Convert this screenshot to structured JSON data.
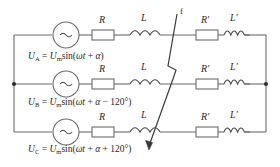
{
  "diagram": {
    "fault_marker_label": "f",
    "phases": [
      {
        "name": "A",
        "source_symbol": "~",
        "equation_html": "<i>U</i><sub>A</sub> = <i>U</i><sub>m</sub>sin(<i>&#969;t</i> + <i>&#945;</i>)",
        "components": [
          {
            "id": "R",
            "label": "R",
            "type": "resistor"
          },
          {
            "id": "L",
            "label": "L",
            "type": "inductor"
          },
          {
            "id": "Rp",
            "label": "R′",
            "type": "resistor"
          },
          {
            "id": "Lp",
            "label": "L′",
            "type": "inductor"
          }
        ]
      },
      {
        "name": "B",
        "source_symbol": "~",
        "equation_html": "<i>U</i><sub>B</sub> = <i>U</i><sub>m</sub>sin(<i>&#969;t</i> + <i>&#945;</i> &#8722; 120&#176;)",
        "components": [
          {
            "id": "R",
            "label": "R",
            "type": "resistor"
          },
          {
            "id": "L",
            "label": "L",
            "type": "inductor"
          },
          {
            "id": "Rp",
            "label": "R′",
            "type": "resistor"
          },
          {
            "id": "Lp",
            "label": "L′",
            "type": "inductor"
          }
        ]
      },
      {
        "name": "C",
        "source_symbol": "~",
        "equation_html": "<i>U</i><sub>C</sub> = <i>U</i><sub>m</sub>sin(<i>&#969;t</i> + <i>&#945;</i> + 120&#176;)",
        "components": [
          {
            "id": "R",
            "label": "R",
            "type": "resistor"
          },
          {
            "id": "L",
            "label": "L",
            "type": "inductor"
          },
          {
            "id": "Rp",
            "label": "R′",
            "type": "resistor"
          },
          {
            "id": "Lp",
            "label": "L′",
            "type": "inductor"
          }
        ]
      }
    ],
    "labels": {
      "R_top": "R",
      "L_top": "L",
      "Rp_top": "R′",
      "Lp_top": "L′",
      "R_mid": "R",
      "L_mid": "L",
      "Rp_mid": "R′",
      "Lp_mid": "L′",
      "R_bot": "R",
      "L_bot": "L",
      "Rp_bot": "R′",
      "Lp_bot": "L′"
    },
    "colors": {
      "wire": "#6b6b6b",
      "component": "#4a4a4a",
      "fault": "#3a3a3a",
      "text": "#1f1f1f",
      "background": "#ffffff"
    }
  }
}
